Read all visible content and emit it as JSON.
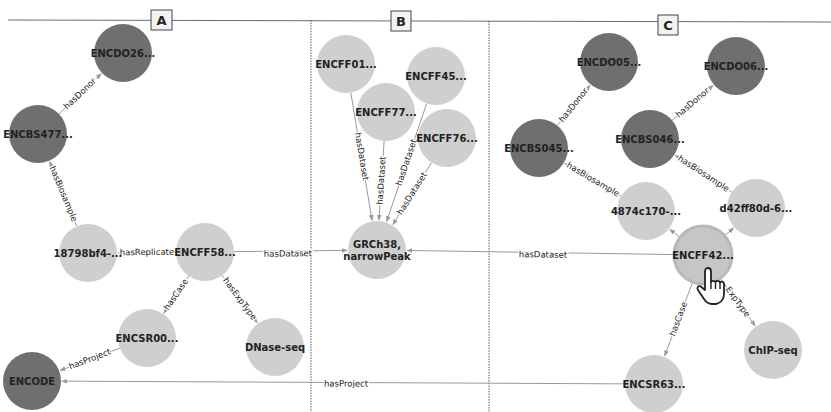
{
  "colors": {
    "dark_node": "#6f6f6f",
    "light_node": "#cfcfcf",
    "highlight_node": "#c6c6c6",
    "edge": "#9a9a9a",
    "divider": "#555555",
    "tag_bg": "#f2f2f2"
  },
  "panels": [
    {
      "id": "A",
      "label": "A"
    },
    {
      "id": "B",
      "label": "B"
    },
    {
      "id": "C",
      "label": "C"
    }
  ],
  "nodes": [
    {
      "id": "a_donor",
      "label": "ENCDO26...",
      "kind": "dark"
    },
    {
      "id": "a_bios",
      "label": "ENCBS477...",
      "kind": "dark"
    },
    {
      "id": "a_rep",
      "label": "18798bf4-...",
      "kind": "light"
    },
    {
      "id": "a_file",
      "label": "ENCFF58...",
      "kind": "light"
    },
    {
      "id": "a_case",
      "label": "ENCSR00...",
      "kind": "light"
    },
    {
      "id": "a_exp",
      "label": "DNase-seq",
      "kind": "light"
    },
    {
      "id": "encode",
      "label": "ENCODE",
      "kind": "dark"
    },
    {
      "id": "b_f01",
      "label": "ENCFF01...",
      "kind": "light"
    },
    {
      "id": "b_f45",
      "label": "ENCFF45...",
      "kind": "light"
    },
    {
      "id": "b_f77",
      "label": "ENCFF77...",
      "kind": "light"
    },
    {
      "id": "b_f76",
      "label": "ENCFF76...",
      "kind": "light"
    },
    {
      "id": "b_ds",
      "label": "GRCh38,\nnarrowPeak",
      "kind": "light"
    },
    {
      "id": "c_do05",
      "label": "ENCDO05...",
      "kind": "dark"
    },
    {
      "id": "c_do06",
      "label": "ENCDO06...",
      "kind": "dark"
    },
    {
      "id": "c_bs045",
      "label": "ENCBS045...",
      "kind": "dark"
    },
    {
      "id": "c_bs046",
      "label": "ENCBS046...",
      "kind": "dark"
    },
    {
      "id": "c_r1",
      "label": "4874c170-...",
      "kind": "light"
    },
    {
      "id": "c_r2",
      "label": "d42ff80d-6...",
      "kind": "light"
    },
    {
      "id": "c_file",
      "label": "ENCFF42...",
      "kind": "highlight"
    },
    {
      "id": "c_exp",
      "label": "ChIP-seq",
      "kind": "light"
    },
    {
      "id": "c_case",
      "label": "ENCSR63...",
      "kind": "light"
    }
  ],
  "edges": [
    {
      "from": "a_bios",
      "to": "a_donor",
      "label": "hasDonor"
    },
    {
      "from": "a_rep",
      "to": "a_bios",
      "label": "hasBiosample"
    },
    {
      "from": "a_file",
      "to": "a_rep",
      "label": "hasReplicate"
    },
    {
      "from": "a_file",
      "to": "b_ds",
      "label": "hasDataset"
    },
    {
      "from": "a_file",
      "to": "a_case",
      "label": "hasCase"
    },
    {
      "from": "a_file",
      "to": "a_exp",
      "label": "hasExpType"
    },
    {
      "from": "a_case",
      "to": "encode",
      "label": "hasProject"
    },
    {
      "from": "b_f01",
      "to": "b_ds",
      "label": "hasDataset"
    },
    {
      "from": "b_f77",
      "to": "b_ds",
      "label": "hasDataset"
    },
    {
      "from": "b_f45",
      "to": "b_ds",
      "label": "hasDataset"
    },
    {
      "from": "b_f76",
      "to": "b_ds",
      "label": "hasDataset"
    },
    {
      "from": "c_bs045",
      "to": "c_do05",
      "label": "hasDonor"
    },
    {
      "from": "c_bs046",
      "to": "c_do06",
      "label": "hasDonor"
    },
    {
      "from": "c_r1",
      "to": "c_bs045",
      "label": "hasBiosample"
    },
    {
      "from": "c_r2",
      "to": "c_bs046",
      "label": "hasBiosample"
    },
    {
      "from": "c_file",
      "to": "c_r1",
      "label": ""
    },
    {
      "from": "c_file",
      "to": "c_r2",
      "label": ""
    },
    {
      "from": "c_file",
      "to": "b_ds",
      "label": "hasDataset"
    },
    {
      "from": "c_file",
      "to": "c_case",
      "label": "hasCase"
    },
    {
      "from": "c_file",
      "to": "c_exp",
      "label": "ExpType"
    },
    {
      "from": "c_case",
      "to": "encode",
      "label": "hasProject"
    }
  ],
  "cursor": {
    "icon": "hand-pointer-icon",
    "over_node": "c_file"
  }
}
